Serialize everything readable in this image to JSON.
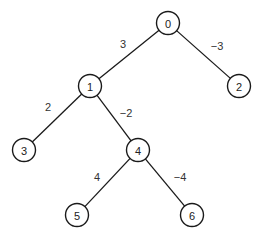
{
  "diagram": {
    "type": "binary-tree",
    "nodes": [
      {
        "id": "0",
        "label": "0",
        "x": 168,
        "y": 23
      },
      {
        "id": "1",
        "label": "1",
        "x": 90,
        "y": 86
      },
      {
        "id": "2",
        "label": "2",
        "x": 239,
        "y": 86
      },
      {
        "id": "3",
        "label": "3",
        "x": 24,
        "y": 150
      },
      {
        "id": "4",
        "label": "4",
        "x": 138,
        "y": 150
      },
      {
        "id": "5",
        "label": "5",
        "x": 77,
        "y": 215
      },
      {
        "id": "6",
        "label": "6",
        "x": 192,
        "y": 215
      }
    ],
    "edges": [
      {
        "from": "0",
        "to": "1",
        "weight": "3",
        "label_x": 123,
        "label_y": 44
      },
      {
        "from": "0",
        "to": "2",
        "weight": "−3",
        "label_x": 217,
        "label_y": 46
      },
      {
        "from": "1",
        "to": "3",
        "weight": "2",
        "label_x": 48,
        "label_y": 107
      },
      {
        "from": "1",
        "to": "4",
        "weight": "−2",
        "label_x": 126,
        "label_y": 113
      },
      {
        "from": "4",
        "to": "5",
        "weight": "4",
        "label_x": 97,
        "label_y": 177
      },
      {
        "from": "4",
        "to": "6",
        "weight": "−4",
        "label_x": 180,
        "label_y": 177
      }
    ],
    "node_radius": 11.5,
    "colors": {
      "stroke": "#1a1a1a",
      "fill": "#ffffff",
      "text": "#222222"
    }
  }
}
